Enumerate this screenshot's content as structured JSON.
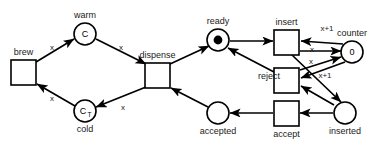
{
  "diagram": {
    "type": "petri-net",
    "title": "",
    "background_color": "#ffffff",
    "stroke_color": "#000000",
    "places": [
      {
        "id": "warm",
        "label": "warm",
        "inner": "C",
        "inner_sub": "",
        "tokens": 0,
        "cx": 85,
        "cy": 34,
        "r": 11,
        "label_pos": "above"
      },
      {
        "id": "cold",
        "label": "cold",
        "inner": "C",
        "inner_sub": "T",
        "tokens": 0,
        "cx": 85,
        "cy": 111,
        "r": 11,
        "label_pos": "below"
      },
      {
        "id": "ready",
        "label": "ready",
        "inner": "",
        "inner_sub": "",
        "tokens": 1,
        "cx": 218,
        "cy": 40,
        "r": 11,
        "label_pos": "above"
      },
      {
        "id": "accepted",
        "label": "accepted",
        "inner": "",
        "inner_sub": "",
        "tokens": 0,
        "cx": 218,
        "cy": 113,
        "r": 11,
        "label_pos": "below"
      },
      {
        "id": "counter",
        "label": "counter",
        "inner": "0",
        "inner_sub": "",
        "tokens": 0,
        "cx": 352,
        "cy": 52,
        "r": 11,
        "label_pos": "above"
      },
      {
        "id": "inserted",
        "label": "inserted",
        "inner": "",
        "inner_sub": "",
        "tokens": 0,
        "cx": 345,
        "cy": 113,
        "r": 11,
        "label_pos": "below"
      }
    ],
    "transitions": [
      {
        "id": "brew",
        "label": "brew",
        "x": 11,
        "y": 60,
        "w": 25,
        "h": 25,
        "label_pos": "above"
      },
      {
        "id": "dispense",
        "label": "dispense",
        "x": 145,
        "y": 63,
        "w": 25,
        "h": 25,
        "label_pos": "above"
      },
      {
        "id": "insert",
        "label": "insert",
        "x": 274,
        "y": 30,
        "w": 25,
        "h": 25,
        "label_pos": "above"
      },
      {
        "id": "reject",
        "label": "reject",
        "x": 274,
        "y": 68,
        "w": 25,
        "h": 25,
        "label_pos": "left"
      },
      {
        "id": "accept",
        "label": "accept",
        "x": 274,
        "y": 101,
        "w": 25,
        "h": 25,
        "label_pos": "below"
      }
    ],
    "arcs": [
      {
        "id": "brew-to-warm",
        "from": "brew",
        "to": "warm",
        "label": "x",
        "lx": 52,
        "ly": 48,
        "x1": 36,
        "y1": 62,
        "x2": 74,
        "y2": 39
      },
      {
        "id": "warm-to-dispense",
        "from": "warm",
        "to": "dispense",
        "label": "x",
        "lx": 121,
        "ly": 48,
        "x1": 96,
        "y1": 39,
        "x2": 146,
        "y2": 64
      },
      {
        "id": "cold-to-brew",
        "from": "cold",
        "to": "brew",
        "label": "x",
        "lx": 52,
        "ly": 99,
        "x1": 75,
        "y1": 106,
        "x2": 37,
        "y2": 84
      },
      {
        "id": "dispense-to-cold",
        "from": "dispense",
        "to": "cold",
        "label": "x",
        "lx": 123,
        "ly": 108,
        "x1": 146,
        "y1": 87,
        "x2": 96,
        "y2": 107
      },
      {
        "id": "dispense-to-ready",
        "from": "dispense",
        "to": "ready",
        "label": "",
        "lx": 0,
        "ly": 0,
        "x1": 170,
        "y1": 64,
        "x2": 209,
        "y2": 46
      },
      {
        "id": "accepted-to-dispense",
        "from": "accepted",
        "to": "dispense",
        "label": "",
        "lx": 0,
        "ly": 0,
        "x1": 208,
        "y1": 107,
        "x2": 171,
        "y2": 88
      },
      {
        "id": "ready-to-insert",
        "from": "ready",
        "to": "insert",
        "label": "",
        "lx": 0,
        "ly": 0,
        "x1": 230,
        "y1": 41,
        "x2": 273,
        "y2": 41
      },
      {
        "id": "reject-to-ready",
        "from": "reject",
        "to": "ready",
        "label": "",
        "lx": 0,
        "ly": 0,
        "x1": 274,
        "y1": 72,
        "x2": 228,
        "y2": 48
      },
      {
        "id": "counter-to-insert",
        "from": "counter",
        "to": "insert",
        "label": "x+1",
        "lx": 327,
        "ly": 29,
        "x1": 343,
        "y1": 44,
        "x2": 301,
        "y2": 41
      },
      {
        "id": "insert-to-counter",
        "from": "insert",
        "to": "counter",
        "label": "x",
        "lx": 312,
        "ly": 50,
        "x1": 300,
        "y1": 51,
        "x2": 341,
        "y2": 51
      },
      {
        "id": "counter-to-reject",
        "from": "counter",
        "to": "reject",
        "label": "x+1",
        "lx": 325,
        "ly": 76,
        "x1": 345,
        "y1": 62,
        "x2": 301,
        "y2": 78
      },
      {
        "id": "reject-to-counter",
        "from": "reject",
        "to": "counter",
        "label": "x",
        "lx": 311,
        "ly": 62,
        "x1": 300,
        "y1": 70,
        "x2": 341,
        "y2": 57
      },
      {
        "id": "insert-to-inserted",
        "from": "insert",
        "to": "inserted",
        "label": "",
        "lx": 0,
        "ly": 0,
        "x1": 292,
        "y1": 55,
        "x2": 341,
        "y2": 102
      },
      {
        "id": "inserted-to-reject",
        "from": "inserted",
        "to": "reject",
        "label": "",
        "lx": 0,
        "ly": 0,
        "x1": 334,
        "y1": 105,
        "x2": 301,
        "y2": 86
      },
      {
        "id": "inserted-to-accept",
        "from": "inserted",
        "to": "accept",
        "label": "",
        "lx": 0,
        "ly": 0,
        "x1": 333,
        "y1": 113,
        "x2": 300,
        "y2": 113
      },
      {
        "id": "accept-to-accepted",
        "from": "accept",
        "to": "accepted",
        "label": "",
        "lx": 0,
        "ly": 0,
        "x1": 273,
        "y1": 113,
        "x2": 230,
        "y2": 113
      }
    ]
  }
}
